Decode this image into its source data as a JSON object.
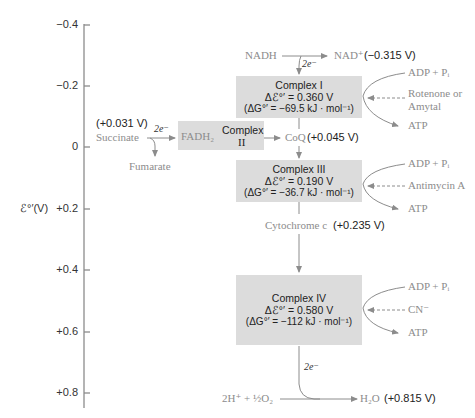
{
  "axis": {
    "label": "ℰ°′(V)",
    "ticks": [
      "−0.4",
      "−0.2",
      "0",
      "+0.2",
      "+0.4",
      "+0.6",
      "+0.8"
    ]
  },
  "top": {
    "nadh": "NADH",
    "electrons": "2e⁻",
    "nad": "NAD⁺",
    "nad_potential": "(−0.315 V)"
  },
  "complexes": [
    {
      "name": "Complex I",
      "delta_e": "Δℰ°′ = 0.360 V",
      "delta_g": "(ΔG°′ = −69.5 kJ · mol⁻¹)",
      "adp": "ADP + Pᵢ",
      "inhibitor_line1": "Rotenone or",
      "inhibitor_line2": "Amytal",
      "atp": "ATP"
    },
    {
      "name_line1": "Complex",
      "name_line2": "II",
      "fadh2": "FADH₂"
    },
    {
      "name": "Complex III",
      "delta_e": "Δℰ°′ = 0.190 V",
      "delta_g": "(ΔG°′ = −36.7 kJ · mol⁻¹)",
      "adp": "ADP + Pᵢ",
      "inhibitor": "Antimycin A",
      "atp": "ATP"
    },
    {
      "name": "Complex IV",
      "delta_e": "Δℰ°′ = 0.580 V",
      "delta_g": "(ΔG°′ = −112 kJ · mol⁻¹)",
      "adp": "ADP + Pᵢ",
      "inhibitor": "CN⁻",
      "atp": "ATP"
    }
  ],
  "succinate": {
    "potential": "(+0.031 V)",
    "label": "Succinate",
    "electrons": "2e⁻",
    "fumarate": "Fumarate"
  },
  "coq": {
    "label": "CoQ",
    "potential": "(+0.045 V)"
  },
  "cytc": {
    "label": "Cytochrome c",
    "potential": "(+0.235 V)"
  },
  "bottom": {
    "electrons": "2e⁻",
    "oxygen": "2H⁺ + ½O₂",
    "water": "H₂O",
    "water_potential": "(+0.815 V)"
  },
  "colors": {
    "box": "#dcdcdc",
    "line": "#8c8c8c",
    "reagent_text": "#8c8c8c",
    "value_text": "#222222"
  }
}
